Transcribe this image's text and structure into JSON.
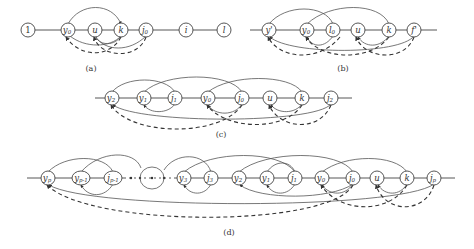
{
  "panels": [
    {
      "id": "a",
      "caption": "(a)",
      "nodes": [
        "1",
        "y0",
        "u",
        "k",
        "j0",
        "i",
        "l"
      ]
    },
    {
      "id": "b",
      "caption": "(b)",
      "nodes": [
        "y'",
        "y0",
        "l0",
        "u",
        "k",
        "f'"
      ]
    },
    {
      "id": "c",
      "caption": "(c)",
      "nodes": [
        "y2",
        "y1",
        "j1",
        "y0",
        "j0",
        "u",
        "k",
        "j2"
      ]
    },
    {
      "id": "d",
      "caption": "(d)",
      "nodes": [
        "yp",
        "yp-1",
        "jp-1",
        "...",
        "y3",
        "j3",
        "y2",
        "y1",
        "j1",
        "y0",
        "j0",
        "u",
        "k",
        "jp"
      ]
    }
  ],
  "labels": {
    "a": {
      "n1": "1",
      "y0": "y",
      "y0s": "0",
      "u": "u",
      "k": "k",
      "j0": "j",
      "j0s": "0",
      "i": "i",
      "l": "l",
      "cap": "(a)"
    },
    "b": {
      "yp": "y'",
      "y0": "y",
      "y0s": "0",
      "l0": "l",
      "l0s": "0",
      "u": "u",
      "k": "k",
      "f": "f'",
      "cap": "(b)"
    },
    "c": {
      "y2": "y",
      "y2s": "2",
      "y1": "y",
      "y1s": "1",
      "j1": "j",
      "j1s": "1",
      "y0": "y",
      "y0s": "0",
      "j0": "j",
      "j0s": "0",
      "u": "u",
      "k": "k",
      "j2": "j",
      "j2s": "2",
      "cap": "(c)"
    },
    "d": {
      "yp": "y",
      "yps": "p",
      "yp1": "y",
      "yp1s": "p-1",
      "jp1": "j",
      "jp1s": "p-1",
      "y3": "y",
      "y3s": "3",
      "j3": "j",
      "j3s": "3",
      "y2": "y",
      "y2s": "2",
      "y1": "y",
      "y1s": "1",
      "j1": "j",
      "j1s": "1",
      "y0": "y",
      "y0s": "0",
      "j0": "j",
      "j0s": "0",
      "u": "u",
      "k": "k",
      "jp": "j",
      "jps": "p",
      "cap": "(d)"
    }
  }
}
